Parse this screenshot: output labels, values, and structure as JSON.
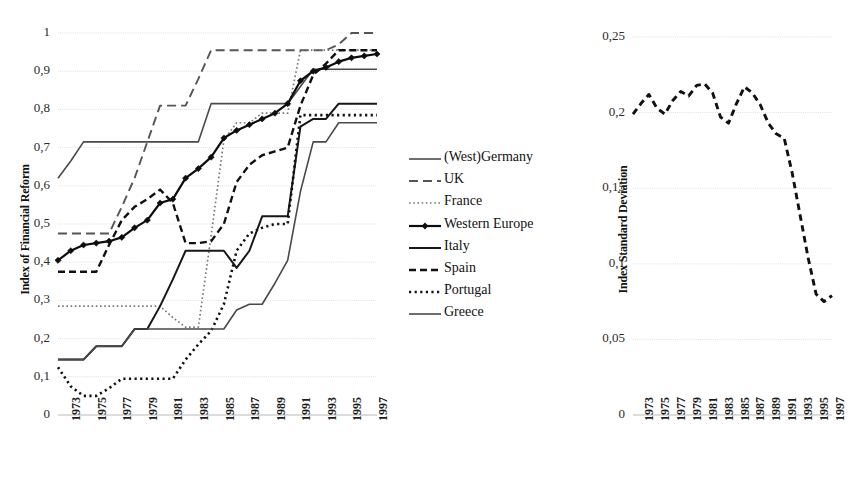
{
  "chart_data": [
    {
      "type": "line",
      "id": "index-of-financial-reform",
      "title": "",
      "xlabel": "",
      "ylabel": "Index of Financial Reform",
      "ylim": [
        0,
        1
      ],
      "xlim": [
        1973,
        1998
      ],
      "grid": true,
      "legend_position": "right",
      "ytick_labels": [
        "1",
        "0,9",
        "0,8",
        "0,7",
        "0,6",
        "0,5",
        "0,4",
        "0,3",
        "0,2",
        "0,1",
        "0"
      ],
      "ytick_values": [
        1,
        0.9,
        0.8,
        0.7,
        0.6,
        0.5,
        0.4,
        0.3,
        0.2,
        0.1,
        0
      ],
      "xtick_labels": [
        "1973",
        "1975",
        "1977",
        "1979",
        "1981",
        "1983",
        "1985",
        "1987",
        "1989",
        "1991",
        "1993",
        "1995",
        "1997"
      ],
      "x": [
        1973,
        1974,
        1975,
        1976,
        1977,
        1978,
        1979,
        1980,
        1981,
        1982,
        1983,
        1984,
        1985,
        1986,
        1987,
        1988,
        1989,
        1990,
        1991,
        1992,
        1993,
        1994,
        1995,
        1996,
        1997,
        1998
      ],
      "series": [
        {
          "name": "(West)Germany",
          "style": "solid-thin",
          "values": [
            0.62,
            0.665,
            0.715,
            0.715,
            0.715,
            0.715,
            0.715,
            0.715,
            0.715,
            0.715,
            0.715,
            0.715,
            0.815,
            0.815,
            0.815,
            0.815,
            0.815,
            0.815,
            0.815,
            0.86,
            0.905,
            0.905,
            0.905,
            0.905,
            0.905,
            0.905
          ]
        },
        {
          "name": "UK",
          "style": "dashed-long",
          "values": [
            0.475,
            0.475,
            0.475,
            0.475,
            0.475,
            0.545,
            0.62,
            0.715,
            0.81,
            0.81,
            0.81,
            0.88,
            0.955,
            0.955,
            0.955,
            0.955,
            0.955,
            0.955,
            0.955,
            0.955,
            0.955,
            0.955,
            0.97,
            1.0,
            1.0,
            1.0
          ]
        },
        {
          "name": "France",
          "style": "dotted-fine",
          "values": [
            0.285,
            0.285,
            0.285,
            0.285,
            0.285,
            0.285,
            0.285,
            0.285,
            0.285,
            0.255,
            0.23,
            0.23,
            0.47,
            0.72,
            0.765,
            0.765,
            0.79,
            0.79,
            0.79,
            0.955,
            0.955,
            0.955,
            0.955,
            0.955,
            0.955,
            0.955
          ]
        },
        {
          "name": "Western Europe",
          "style": "solid-marker",
          "values": [
            0.405,
            0.43,
            0.445,
            0.45,
            0.455,
            0.465,
            0.49,
            0.51,
            0.555,
            0.565,
            0.62,
            0.645,
            0.675,
            0.725,
            0.745,
            0.76,
            0.775,
            0.79,
            0.815,
            0.875,
            0.9,
            0.91,
            0.925,
            0.935,
            0.94,
            0.945
          ]
        },
        {
          "name": "Italy",
          "style": "solid-medium",
          "values": [
            0.145,
            0.145,
            0.145,
            0.18,
            0.18,
            0.18,
            0.225,
            0.225,
            0.285,
            0.355,
            0.43,
            0.43,
            0.43,
            0.43,
            0.385,
            0.43,
            0.52,
            0.52,
            0.52,
            0.755,
            0.775,
            0.775,
            0.815,
            0.815,
            0.815,
            0.815
          ]
        },
        {
          "name": "Spain",
          "style": "dashed-medium",
          "values": [
            0.375,
            0.375,
            0.375,
            0.375,
            0.445,
            0.51,
            0.545,
            0.565,
            0.59,
            0.555,
            0.45,
            0.45,
            0.455,
            0.5,
            0.61,
            0.655,
            0.68,
            0.69,
            0.7,
            0.81,
            0.89,
            0.92,
            0.955,
            0.955,
            0.955,
            0.955
          ]
        },
        {
          "name": "Portugal",
          "style": "dotted-bold",
          "values": [
            0.125,
            0.075,
            0.05,
            0.05,
            0.07,
            0.095,
            0.095,
            0.095,
            0.095,
            0.095,
            0.145,
            0.185,
            0.22,
            0.29,
            0.43,
            0.475,
            0.49,
            0.5,
            0.5,
            0.785,
            0.785,
            0.785,
            0.785,
            0.785,
            0.785,
            0.785
          ]
        },
        {
          "name": "Greece",
          "style": "solid-thin",
          "values": [
            0.145,
            0.145,
            0.145,
            0.18,
            0.18,
            0.18,
            0.225,
            0.225,
            0.225,
            0.225,
            0.225,
            0.225,
            0.225,
            0.225,
            0.275,
            0.29,
            0.29,
            0.345,
            0.405,
            0.585,
            0.715,
            0.715,
            0.765,
            0.765,
            0.765,
            0.765
          ]
        }
      ]
    },
    {
      "type": "line",
      "id": "index-standard-deviation",
      "title": "",
      "xlabel": "",
      "ylabel": "Index Standard Deviation",
      "ylim": [
        0,
        0.25
      ],
      "xlim": [
        1973,
        1998
      ],
      "grid": true,
      "legend_position": "none",
      "ytick_labels": [
        "0,25",
        "0,2",
        "0,15",
        "0,1",
        "0,05",
        "0"
      ],
      "ytick_values": [
        0.25,
        0.2,
        0.15,
        0.1,
        0.05,
        0
      ],
      "xtick_labels": [
        "1973",
        "1975",
        "1977",
        "1979",
        "1981",
        "1983",
        "1985",
        "1987",
        "1989",
        "1991",
        "1993",
        "1995",
        "1997"
      ],
      "x": [
        1973,
        1974,
        1975,
        1976,
        1977,
        1978,
        1979,
        1980,
        1981,
        1982,
        1983,
        1984,
        1985,
        1986,
        1987,
        1988,
        1989,
        1990,
        1991,
        1992,
        1993,
        1994,
        1995,
        1996,
        1997,
        1998
      ],
      "series": [
        {
          "name": "Index Standard Deviation",
          "style": "dashed-bold",
          "values": [
            0.199,
            0.206,
            0.212,
            0.203,
            0.199,
            0.208,
            0.214,
            0.211,
            0.218,
            0.219,
            0.213,
            0.197,
            0.193,
            0.206,
            0.217,
            0.213,
            0.205,
            0.193,
            0.186,
            0.183,
            0.16,
            0.132,
            0.104,
            0.08,
            0.075,
            0.079,
            0.074
          ]
        }
      ]
    }
  ]
}
